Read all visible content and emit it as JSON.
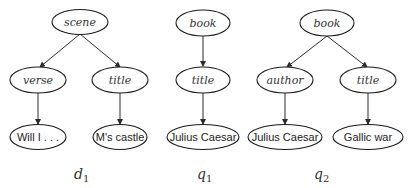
{
  "trees": [
    {
      "id": "d1",
      "caption": {
        "letter": "d",
        "subscript": "1"
      },
      "nodes": [
        {
          "key": "scene",
          "label": "scene",
          "style": "italic"
        },
        {
          "key": "verse",
          "label": "verse",
          "style": "italic"
        },
        {
          "key": "title",
          "label": "title",
          "style": "italic"
        },
        {
          "key": "will",
          "label": "Will I . . .",
          "style": "sans"
        },
        {
          "key": "castle",
          "label": "M's castle",
          "style": "sans"
        }
      ],
      "edges": [
        [
          "scene",
          "verse"
        ],
        [
          "scene",
          "title"
        ],
        [
          "verse",
          "will"
        ],
        [
          "title",
          "castle"
        ]
      ]
    },
    {
      "id": "q1",
      "caption": {
        "letter": "q",
        "subscript": "1"
      },
      "nodes": [
        {
          "key": "book",
          "label": "book",
          "style": "italic"
        },
        {
          "key": "title",
          "label": "title",
          "style": "italic"
        },
        {
          "key": "caesar",
          "label": "Julius Caesar",
          "style": "sans"
        }
      ],
      "edges": [
        [
          "book",
          "title"
        ],
        [
          "title",
          "caesar"
        ]
      ]
    },
    {
      "id": "q2",
      "caption": {
        "letter": "q",
        "subscript": "2"
      },
      "nodes": [
        {
          "key": "book",
          "label": "book",
          "style": "italic"
        },
        {
          "key": "author",
          "label": "author",
          "style": "italic"
        },
        {
          "key": "title",
          "label": "title",
          "style": "italic"
        },
        {
          "key": "caesar",
          "label": "Julius Caesar",
          "style": "sans"
        },
        {
          "key": "gallic",
          "label": "Gallic war",
          "style": "sans"
        }
      ],
      "edges": [
        [
          "book",
          "author"
        ],
        [
          "book",
          "title"
        ],
        [
          "author",
          "caesar"
        ],
        [
          "title",
          "gallic"
        ]
      ]
    }
  ]
}
